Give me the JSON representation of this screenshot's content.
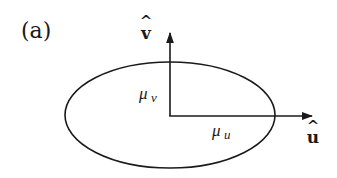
{
  "panel_label": "(a)",
  "axes": {
    "v": {
      "label": "v",
      "hat": "^"
    },
    "u": {
      "label": "u",
      "hat": "^"
    }
  },
  "annotations": {
    "mu_v": {
      "symbol": "μ",
      "subscript": "v"
    },
    "mu_u": {
      "symbol": "μ",
      "subscript": "u"
    }
  },
  "colors": {
    "stroke": "#1a1a1a",
    "background": "#ffffff"
  }
}
